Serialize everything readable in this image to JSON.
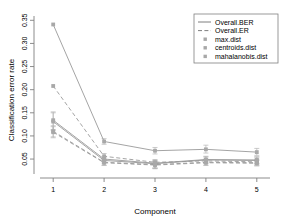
{
  "chart_data": {
    "type": "line",
    "title": "",
    "xlabel": "Component",
    "ylabel": "Classification error rate",
    "x": [
      1,
      2,
      3,
      4,
      5
    ],
    "xticklabels": [
      "1",
      "2",
      "3",
      "4",
      "5"
    ],
    "yticks": [
      0.05,
      0.1,
      0.15,
      0.2,
      0.25,
      0.3,
      0.35
    ],
    "yticklabels": [
      "0.05",
      "0.10",
      "0.15",
      "0.20",
      "0.25",
      "0.30",
      "0.35"
    ],
    "xlim": [
      0.78,
      5.22
    ],
    "ylim": [
      0.022,
      0.355
    ],
    "grid": false,
    "legend_position": "top-right",
    "legend": [
      {
        "label": "Overall.BER",
        "style": "solid-line"
      },
      {
        "label": "Overall.ER",
        "style": "dashed-line"
      },
      {
        "label": "max.dist",
        "style": "point"
      },
      {
        "label": "centroids.dist",
        "style": "point"
      },
      {
        "label": "mahalanobis.dist",
        "style": "point"
      }
    ],
    "line_color": "#9a9a9a",
    "point_color": "#a8a8a8",
    "errorbar_color": "#b4b4b4",
    "axis_color": "#808080",
    "series": [
      {
        "name": "max.dist Overall.BER",
        "dist": "max.dist",
        "measure": "Overall.BER",
        "style": "solid",
        "values": [
          0.341,
          0.088,
          0.068,
          0.071,
          0.065
        ],
        "err_low": [
          0.341,
          0.082,
          0.061,
          0.063,
          0.058
        ],
        "err_high": [
          0.341,
          0.094,
          0.075,
          0.08,
          0.073
        ]
      },
      {
        "name": "max.dist Overall.ER",
        "dist": "max.dist",
        "measure": "Overall.ER",
        "style": "dashed",
        "values": [
          0.208,
          0.056,
          0.043,
          0.046,
          0.044
        ],
        "err_low": [
          0.208,
          0.05,
          0.038,
          0.041,
          0.039
        ],
        "err_high": [
          0.208,
          0.062,
          0.049,
          0.052,
          0.05
        ]
      },
      {
        "name": "centroids.dist Overall.BER",
        "dist": "centroids.dist",
        "measure": "Overall.BER",
        "style": "solid",
        "values": [
          0.134,
          0.05,
          0.041,
          0.049,
          0.048
        ],
        "err_low": [
          0.114,
          0.044,
          0.031,
          0.042,
          0.041
        ],
        "err_high": [
          0.152,
          0.056,
          0.047,
          0.056,
          0.055
        ]
      },
      {
        "name": "centroids.dist Overall.ER",
        "dist": "centroids.dist",
        "measure": "Overall.ER",
        "style": "dashed",
        "values": [
          0.11,
          0.043,
          0.038,
          0.043,
          0.042
        ],
        "err_low": [
          0.098,
          0.037,
          0.03,
          0.037,
          0.036
        ],
        "err_high": [
          0.122,
          0.049,
          0.045,
          0.049,
          0.048
        ]
      },
      {
        "name": "mahalanobis.dist Overall.BER",
        "dist": "mahalanobis.dist",
        "measure": "Overall.BER",
        "style": "solid",
        "values": [
          0.131,
          0.047,
          0.04,
          0.048,
          0.047
        ],
        "err_low": [
          0.112,
          0.041,
          0.03,
          0.041,
          0.04
        ],
        "err_high": [
          0.15,
          0.053,
          0.046,
          0.055,
          0.054
        ]
      },
      {
        "name": "mahalanobis.dist Overall.ER",
        "dist": "mahalanobis.dist",
        "measure": "Overall.ER",
        "style": "dashed",
        "values": [
          0.108,
          0.042,
          0.037,
          0.042,
          0.041
        ],
        "err_low": [
          0.096,
          0.036,
          0.029,
          0.036,
          0.035
        ],
        "err_high": [
          0.12,
          0.048,
          0.044,
          0.048,
          0.047
        ]
      }
    ]
  }
}
